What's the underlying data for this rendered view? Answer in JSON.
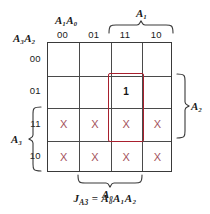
{
  "colors": {
    "grid_line": "#4a4a4a",
    "grid_border": "#3a3a3a",
    "dontcare_x": "#a4525c",
    "group_box": "#a8202e",
    "text": "#1a1a1a",
    "background": "#ffffff"
  },
  "axes": {
    "column_var_label": "A₁A₀",
    "column_var_base": "A",
    "row_var_label": "A₃A₂",
    "column_headers": [
      "00",
      "01",
      "11",
      "10"
    ],
    "row_headers": [
      "00",
      "01",
      "11",
      "10"
    ]
  },
  "brackets": [
    {
      "name": "A1",
      "label": "A₁",
      "orientation": "top",
      "spans_columns": [
        "11",
        "10"
      ]
    },
    {
      "name": "A2",
      "label": "A₂",
      "orientation": "right",
      "spans_rows": [
        "01",
        "11"
      ]
    },
    {
      "name": "A3",
      "label": "A₃",
      "orientation": "left",
      "spans_rows": [
        "11",
        "10"
      ]
    },
    {
      "name": "A0",
      "label": "A₀",
      "orientation": "bottom",
      "spans_columns": [
        "01",
        "11"
      ]
    }
  ],
  "cells": [
    {
      "row": "00",
      "col": "00",
      "value": ""
    },
    {
      "row": "00",
      "col": "01",
      "value": ""
    },
    {
      "row": "00",
      "col": "11",
      "value": ""
    },
    {
      "row": "00",
      "col": "10",
      "value": ""
    },
    {
      "row": "01",
      "col": "00",
      "value": ""
    },
    {
      "row": "01",
      "col": "01",
      "value": ""
    },
    {
      "row": "01",
      "col": "11",
      "value": "1"
    },
    {
      "row": "01",
      "col": "10",
      "value": ""
    },
    {
      "row": "11",
      "col": "00",
      "value": "X"
    },
    {
      "row": "11",
      "col": "01",
      "value": "X"
    },
    {
      "row": "11",
      "col": "11",
      "value": "X"
    },
    {
      "row": "11",
      "col": "10",
      "value": "X"
    },
    {
      "row": "10",
      "col": "00",
      "value": "X"
    },
    {
      "row": "10",
      "col": "01",
      "value": "X"
    },
    {
      "row": "10",
      "col": "11",
      "value": "X"
    },
    {
      "row": "10",
      "col": "10",
      "value": "X"
    }
  ],
  "group": {
    "name": "prime-implicant-group",
    "covers_cells": [
      {
        "row": "01",
        "col": "11"
      },
      {
        "row": "11",
        "col": "11"
      }
    ]
  },
  "equation": {
    "lhs": "J",
    "lhs_sub": "A3",
    "operator": "=",
    "rhs": "A₀A₁A₂",
    "full": "J_A3 = A0A1A2"
  }
}
